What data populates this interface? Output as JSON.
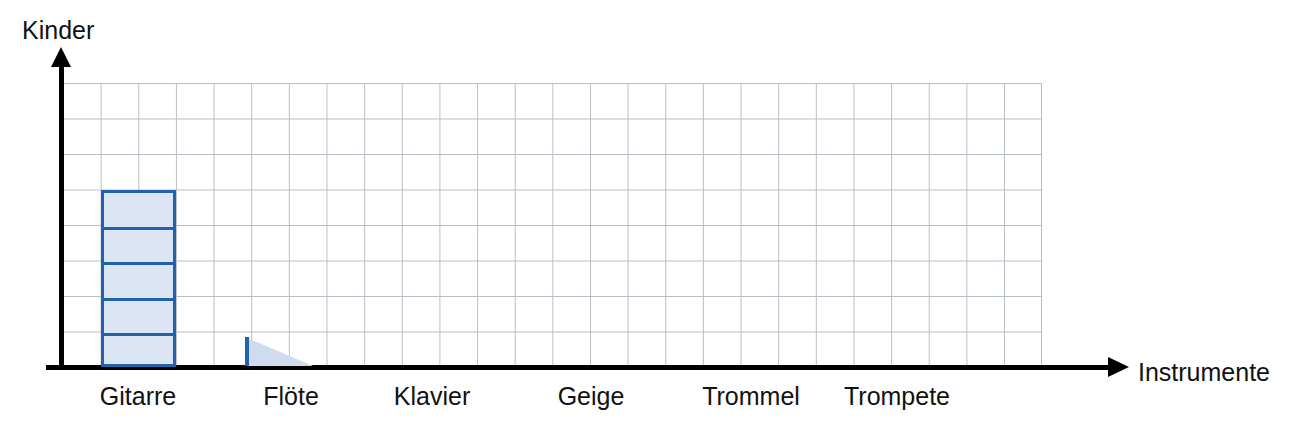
{
  "chart_data": {
    "type": "bar",
    "title": "",
    "xlabel": "Instrumente",
    "ylabel": "Kinder",
    "categories": [
      "Gitarre",
      "Flöte",
      "Klavier",
      "Geige",
      "Trommel",
      "Trompete"
    ],
    "values": [
      5,
      0,
      0,
      0,
      0,
      0
    ],
    "ylim": [
      0,
      8
    ],
    "grid": true,
    "grid_rows": 8,
    "grid_cols": 26,
    "legend": "none",
    "bar_segmented": true,
    "annotations": [
      "Gitarre bar is drawn as 5 stacked unit squares (value 5)",
      "Flöte shows an incomplete triangular drag wedge, no finished bar",
      "Klavier, Geige, Trommel and Trompete have no bars drawn"
    ],
    "colors": {
      "bar_fill": "#dbe5f4",
      "bar_stroke": "#2162ac",
      "wedge_fill": "#cfdcf0",
      "grid_line": "#b9bfc6",
      "axis": "#000000",
      "text": "#111111"
    }
  },
  "axes": {
    "y_title": "Kinder",
    "x_title": "Instrumente"
  },
  "category_labels": [
    {
      "text": "Gitarre",
      "cx": 138
    },
    {
      "text": "Flöte",
      "cx": 291
    },
    {
      "text": "Klavier",
      "cx": 432
    },
    {
      "text": "Geige",
      "cx": 591
    },
    {
      "text": "Trommel",
      "cx": 751
    },
    {
      "text": "Trompete",
      "cx": 897
    }
  ],
  "bars": [
    {
      "name": "Gitarre",
      "value": 5,
      "segments": 5
    }
  ]
}
